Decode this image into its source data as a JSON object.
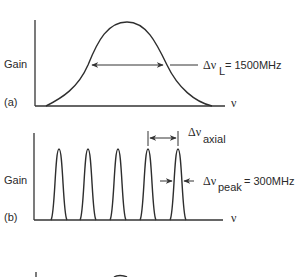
{
  "panel_a": {
    "tag": "(a)",
    "y_label": "Gain",
    "x_label": "ν",
    "curve": "gaussian gain profile",
    "width_symbol": "Δν",
    "width_subscript": "L",
    "width_value": "= 1500MHz"
  },
  "panel_b": {
    "tag": "(b)",
    "y_label": "Gain",
    "x_label": "ν",
    "peak_count": 5,
    "axial_symbol": "Δν",
    "axial_subscript": "axial",
    "peak_symbol": "Δν",
    "peak_subscript": "peak",
    "peak_value": "= 300MHz"
  },
  "panel_c": {
    "note": "partially visible, cut off at bottom"
  },
  "colors": {
    "ink": "#2e2e2e",
    "background": "#ffffff"
  }
}
